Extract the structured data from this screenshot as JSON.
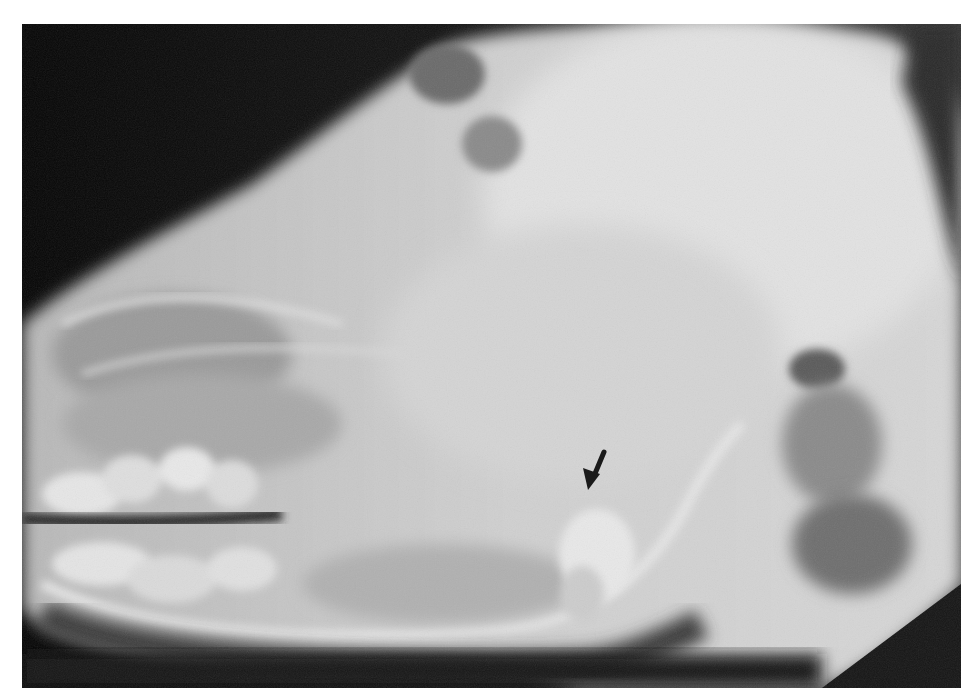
{
  "figure": {
    "type": "radiograph",
    "view": "lateral skull",
    "background_color": "#ffffff",
    "film_color": "#0a0a0a",
    "bone_color": "#d8d8d8"
  },
  "annotation": {
    "type": "arrow",
    "direction": "down-left",
    "color": "#1a1a1a",
    "tip": {
      "x": 588,
      "y": 490
    },
    "tail": {
      "x": 604,
      "y": 452
    }
  }
}
